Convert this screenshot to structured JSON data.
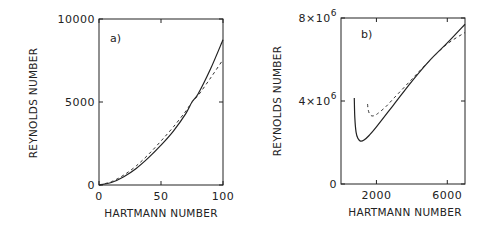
{
  "chart_data": [
    {
      "type": "line",
      "panel_label": "a)",
      "xlabel": "HARTMANN NUMBER",
      "ylabel": "REYNOLDS NUMBER",
      "xlim": [
        0,
        100
      ],
      "ylim": [
        0,
        10000
      ],
      "xticks": [
        0,
        50,
        100
      ],
      "xtick_labels": [
        "0",
        "50",
        "100"
      ],
      "yticks": [
        0,
        5000,
        10000
      ],
      "ytick_labels": [
        "0",
        "5000",
        "10000"
      ],
      "grid": false,
      "series": [
        {
          "name": "solid",
          "style": "solid",
          "x": [
            0,
            10,
            20,
            30,
            40,
            50,
            60,
            70,
            75,
            80,
            90,
            100
          ],
          "y": [
            0,
            150,
            500,
            1000,
            1650,
            2400,
            3250,
            4300,
            5000,
            5500,
            7000,
            8750
          ]
        },
        {
          "name": "dashed",
          "style": "dashed",
          "x": [
            0,
            10,
            20,
            30,
            40,
            50,
            60,
            70,
            75,
            80,
            90,
            100
          ],
          "y": [
            0,
            200,
            600,
            1150,
            1850,
            2650,
            3500,
            4450,
            5000,
            5400,
            6450,
            7550
          ]
        }
      ]
    },
    {
      "type": "line",
      "panel_label": "b)",
      "xlabel": "HARTMANN NUMBER",
      "ylabel": "REYNOLDS NUMBER",
      "xlim": [
        0,
        7000
      ],
      "ylim": [
        0,
        8000000
      ],
      "xticks": [
        2000,
        6000
      ],
      "xtick_labels": [
        "2000",
        "6000"
      ],
      "yticks": [
        0,
        4000000,
        8000000
      ],
      "ytick_labels": [
        {
          "base": "0",
          "exp": ""
        },
        {
          "base": "4×10",
          "exp": "6"
        },
        {
          "base": "8×10",
          "exp": "6"
        }
      ],
      "grid": false,
      "series": [
        {
          "name": "solid",
          "style": "solid",
          "x": [
            750,
            780,
            850,
            950,
            1100,
            1300,
            1600,
            2000,
            3000,
            4000,
            5000,
            6000,
            7000
          ],
          "y": [
            4150000,
            3200000,
            2500000,
            2200000,
            2070000,
            2120000,
            2350000,
            2750000,
            3850000,
            4950000,
            5950000,
            6800000,
            7700000
          ]
        },
        {
          "name": "dashed",
          "style": "dashed",
          "x": [
            1500,
            1530,
            1600,
            1700,
            1800,
            2000,
            2500,
            3000,
            4000,
            5000,
            6000,
            7000
          ],
          "y": [
            3850000,
            3600000,
            3400000,
            3300000,
            3280000,
            3350000,
            3700000,
            4150000,
            5050000,
            5950000,
            6750000,
            7300000
          ]
        }
      ]
    }
  ]
}
